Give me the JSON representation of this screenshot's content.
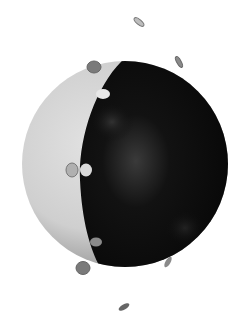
{
  "scene": {
    "subject": "half-lit sphere with small orbiting discs",
    "colors": {
      "background": "#ffffff",
      "lit_side": "#d4d4d4",
      "dark_side": "#0c0c0c",
      "disc_gray": "#7a7a7a",
      "disc_light": "#e6e6e6"
    }
  }
}
